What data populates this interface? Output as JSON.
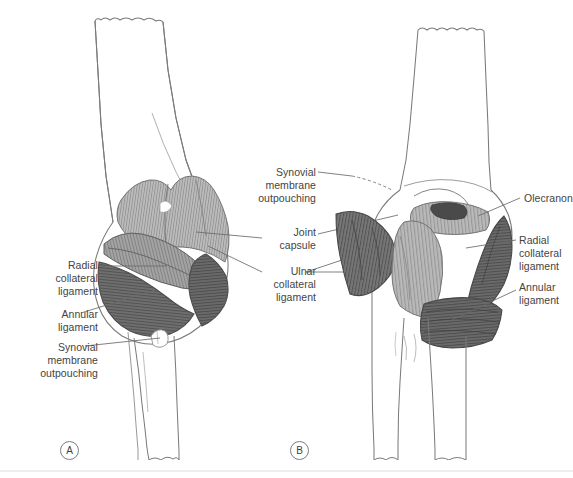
{
  "figure": {
    "background_color": "#ffffff",
    "line_color": "#6e6e6e",
    "bone_outline_color": "#7a7a7a",
    "leader_color": "#6a6a6a",
    "text_color": "#434343",
    "shade_light": "#b5b5b5",
    "shade_mid": "#9a9a9a",
    "shade_dark": "#6b6b6b",
    "shade_darkest": "#555555",
    "border_color": "#d8d8d8"
  },
  "panels": [
    {
      "marker": "A",
      "view_name": "anterolateral-view",
      "marker_x": 60,
      "marker_y": 441
    },
    {
      "marker": "B",
      "view_name": "posterior-view",
      "marker_x": 290,
      "marker_y": 441
    }
  ],
  "labels": [
    {
      "id": "radial-collateral-ligament-left",
      "lines": [
        "Radial",
        "collateral",
        "ligament"
      ],
      "text": "Radial\ncollateral\nligament",
      "side": "left",
      "x": 26,
      "y": 259,
      "width": 72,
      "panel": "A"
    },
    {
      "id": "annular-ligament-left",
      "lines": [
        "Annular",
        "ligament"
      ],
      "text": "Annular\nligament",
      "side": "left",
      "x": 26,
      "y": 308,
      "width": 72,
      "panel": "A"
    },
    {
      "id": "synovial-membrane-outpouching-left",
      "lines": [
        "Synovial",
        "membrane",
        "outpouching"
      ],
      "text": "Synovial\nmembrane\noutpouching",
      "side": "left",
      "x": 14,
      "y": 341,
      "width": 84,
      "panel": "A"
    },
    {
      "id": "synovial-membrane-outpouching-center",
      "lines": [
        "Synovial",
        "membrane",
        "outpouching"
      ],
      "text": "Synovial\nmembrane\noutpouching",
      "side": "center",
      "x": 266,
      "y": 166,
      "width": 72,
      "panel": "B"
    },
    {
      "id": "joint-capsule-center",
      "lines": [
        "Joint",
        "capsule"
      ],
      "text": "Joint\ncapsule",
      "side": "center",
      "x": 266,
      "y": 226,
      "width": 72,
      "panel": "B"
    },
    {
      "id": "ulnar-collateral-ligament-center",
      "lines": [
        "Ulnar",
        "collateral",
        "ligament"
      ],
      "text": "Ulnar\ncollateral\nligament",
      "side": "center",
      "x": 266,
      "y": 265,
      "width": 72,
      "panel": "B"
    },
    {
      "id": "olecranon-right",
      "lines": [
        "Olecranon"
      ],
      "text": "Olecranon",
      "side": "right",
      "x": 524,
      "y": 192,
      "width": 60,
      "panel": "B"
    },
    {
      "id": "radial-collateral-ligament-right",
      "lines": [
        "Radial",
        "collateral",
        "ligament"
      ],
      "text": "Radial\ncollateral\nligament",
      "side": "right",
      "x": 519,
      "y": 234,
      "width": 60,
      "panel": "B"
    },
    {
      "id": "annular-ligament-right",
      "lines": [
        "Annular",
        "ligament"
      ],
      "text": "Annular\nligament",
      "side": "right",
      "x": 519,
      "y": 281,
      "width": 60,
      "panel": "B"
    }
  ],
  "structures": {
    "humerus": "humerus-shaft",
    "radius": "radius-shaft",
    "ulna": "ulna-shaft",
    "olecranon": "olecranon-process",
    "radial_collateral_ligament": "radial-collateral-ligament",
    "ulnar_collateral_ligament": "ulnar-collateral-ligament",
    "annular_ligament": "annular-ligament",
    "joint_capsule": "joint-capsule",
    "synovial_outpouching": "synovial-membrane-outpouching"
  }
}
